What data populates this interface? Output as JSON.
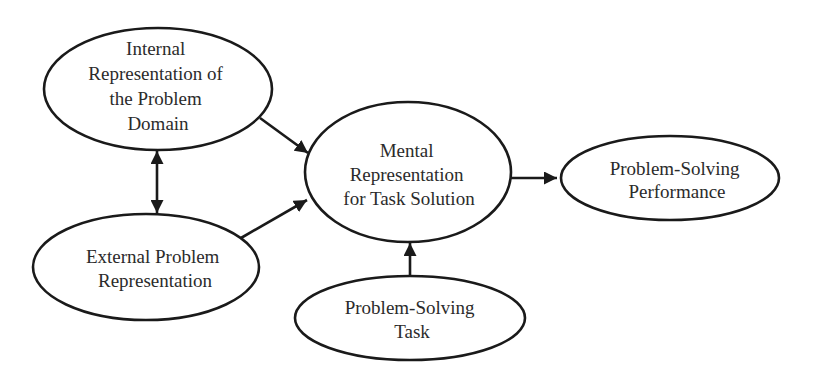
{
  "diagram": {
    "type": "flow-model",
    "colors": {
      "stroke": "#1a1a1a",
      "text": "#2b2b2b",
      "background": "#ffffff"
    },
    "nodes": [
      {
        "id": "internal",
        "shape": "ellipse",
        "lines": [
          "Internal",
          "Representation of",
          "the Problem",
          "Domain"
        ]
      },
      {
        "id": "external",
        "shape": "ellipse",
        "lines": [
          "External Problem",
          "Representation"
        ]
      },
      {
        "id": "mental",
        "shape": "ellipse",
        "lines": [
          "Mental",
          "Representation",
          "for Task Solution"
        ]
      },
      {
        "id": "task",
        "shape": "ellipse",
        "lines": [
          "Problem-Solving",
          "Task"
        ]
      },
      {
        "id": "performance",
        "shape": "ellipse",
        "lines": [
          "Problem-Solving",
          "Performance"
        ]
      }
    ],
    "edges": [
      {
        "from": "internal",
        "to": "external",
        "direction": "bidirectional"
      },
      {
        "from": "internal",
        "to": "mental",
        "direction": "forward"
      },
      {
        "from": "external",
        "to": "mental",
        "direction": "forward"
      },
      {
        "from": "task",
        "to": "mental",
        "direction": "forward"
      },
      {
        "from": "mental",
        "to": "performance",
        "direction": "forward"
      }
    ]
  }
}
